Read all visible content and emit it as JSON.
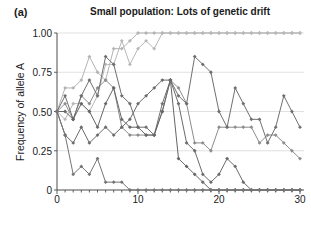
{
  "figure": {
    "panel_label": "(a)",
    "title": "Small population: Lots of genetic drift",
    "ylabel": "Frequency of allele A"
  },
  "chart_data": {
    "type": "line",
    "title": "Small population: Lots of genetic drift",
    "xlabel": "",
    "ylabel": "Frequency of allele A",
    "xlim": [
      0,
      30
    ],
    "ylim": [
      0,
      1.0
    ],
    "xticks": [
      0,
      10,
      20,
      30
    ],
    "xtick_labels": [
      "0",
      "10",
      "20",
      "30"
    ],
    "yticks": [
      0,
      0.25,
      0.5,
      0.75,
      1.0
    ],
    "ytick_labels": [
      "0",
      "0.25",
      "0.50",
      "0.75",
      "1.00"
    ],
    "grid": "horizontal",
    "legend": "none",
    "markers": "diamond",
    "x": [
      0,
      1,
      2,
      3,
      4,
      5,
      6,
      7,
      8,
      9,
      10,
      11,
      12,
      13,
      14,
      15,
      16,
      17,
      18,
      19,
      20,
      21,
      22,
      23,
      24,
      25,
      26,
      27,
      28,
      29,
      30
    ],
    "series": [
      {
        "name": "population-1",
        "color": "#b3b3b3",
        "values": [
          0.5,
          0.65,
          0.65,
          0.7,
          0.85,
          0.75,
          0.7,
          0.9,
          0.9,
          0.95,
          1.0,
          1.0,
          1.0,
          1.0,
          1.0,
          1.0,
          1.0,
          1.0,
          1.0,
          1.0,
          1.0,
          1.0,
          1.0,
          1.0,
          1.0,
          1.0,
          1.0,
          1.0,
          1.0,
          1.0,
          1.0
        ]
      },
      {
        "name": "population-2",
        "color": "#b8b8b8",
        "values": [
          0.5,
          0.45,
          0.55,
          0.55,
          0.5,
          0.6,
          0.8,
          0.8,
          0.95,
          0.8,
          0.9,
          0.95,
          0.9,
          1.0,
          1.0,
          1.0,
          1.0,
          1.0,
          1.0,
          1.0,
          1.0,
          1.0,
          1.0,
          1.0,
          1.0,
          1.0,
          1.0,
          1.0,
          1.0,
          1.0,
          1.0
        ]
      },
      {
        "name": "population-3",
        "color": "#8c8c8c",
        "values": [
          0.5,
          0.55,
          0.45,
          0.6,
          0.55,
          0.65,
          0.7,
          0.65,
          0.4,
          0.35,
          0.35,
          0.35,
          0.35,
          0.5,
          0.7,
          0.65,
          0.55,
          0.3,
          0.3,
          0.25,
          0.4,
          0.4,
          0.4,
          0.4,
          0.4,
          0.3,
          0.35,
          0.35,
          0.3,
          0.25,
          0.2
        ]
      },
      {
        "name": "population-4",
        "color": "#707070",
        "values": [
          0.5,
          0.6,
          0.45,
          0.6,
          0.7,
          0.6,
          0.85,
          0.8,
          0.6,
          0.55,
          0.4,
          0.4,
          0.35,
          0.55,
          0.7,
          0.6,
          0.55,
          0.85,
          0.8,
          0.75,
          0.5,
          0.4,
          0.65,
          0.55,
          0.45,
          0.45,
          0.3,
          0.4,
          0.6,
          0.5,
          0.4
        ]
      },
      {
        "name": "population-5",
        "color": "#666666",
        "values": [
          0.5,
          0.5,
          0.45,
          0.55,
          0.5,
          0.4,
          0.55,
          0.65,
          0.45,
          0.4,
          0.4,
          0.35,
          0.35,
          0.5,
          0.7,
          0.2,
          0.15,
          0.1,
          0.05,
          0.0,
          0.0,
          0.0,
          0.0,
          0.0,
          0.0,
          0.0,
          0.0,
          0.0,
          0.0,
          0.0,
          0.0
        ]
      },
      {
        "name": "population-6",
        "color": "#6b6b6b",
        "values": [
          0.5,
          0.35,
          0.3,
          0.4,
          0.3,
          0.35,
          0.4,
          0.35,
          0.4,
          0.45,
          0.55,
          0.6,
          0.65,
          0.7,
          0.7,
          0.55,
          0.3,
          0.25,
          0.1,
          0.05,
          0.1,
          0.2,
          0.15,
          0.05,
          0.0,
          0.0,
          0.0,
          0.0,
          0.0,
          0.0,
          0.0
        ]
      },
      {
        "name": "population-7",
        "color": "#757575",
        "values": [
          0.5,
          0.35,
          0.1,
          0.15,
          0.1,
          0.2,
          0.05,
          0.05,
          0.05,
          0.0,
          0.0,
          0.0,
          0.0,
          0.0,
          0.0,
          0.0,
          0.0,
          0.0,
          0.0,
          0.0,
          0.0,
          0.0,
          0.0,
          0.0,
          0.0,
          0.0,
          0.0,
          0.0,
          0.0,
          0.0,
          0.0
        ]
      }
    ]
  }
}
